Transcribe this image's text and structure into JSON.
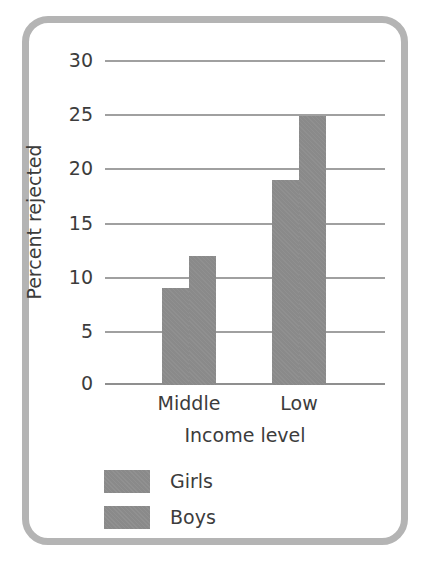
{
  "chart_data": {
    "type": "bar",
    "title": "",
    "xlabel": "Income level",
    "ylabel": "Percent rejected",
    "categories": [
      "Middle",
      "Low"
    ],
    "series": [
      {
        "name": "Girls",
        "values": [
          9,
          12
        ]
      },
      {
        "name": "Boys",
        "values": [
          19,
          25
        ]
      }
    ],
    "series_by_group": [
      {
        "category": "Middle",
        "Girls": 9,
        "Boys": 12
      },
      {
        "category": "Low",
        "Girls": 19,
        "Boys": 25
      }
    ],
    "ylim": [
      0,
      30
    ],
    "ytick_values": [
      0,
      5,
      10,
      15,
      20,
      25,
      30
    ],
    "ytick_labels": [
      "0",
      "5",
      "10",
      "15",
      "20",
      "25",
      "30"
    ],
    "grid": true,
    "grid_axis": "y",
    "legend_position": "bottom-left",
    "legend_entries": [
      "Girls",
      "Boys"
    ],
    "colors": {
      "bar_fill": "#8a8a8a",
      "gridline": "#a0a0a0",
      "text": "#3c3c3c",
      "frame": "#b4b4b4",
      "background": "#ffffff"
    }
  }
}
